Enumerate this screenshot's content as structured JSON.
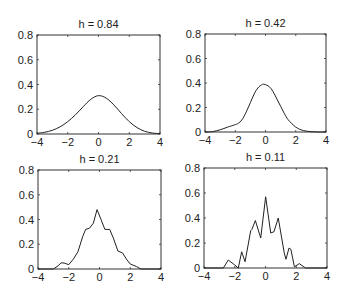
{
  "chart_data": [
    {
      "type": "line",
      "title": "h = 0.84",
      "xlabel": "",
      "ylabel": "",
      "xlim": [
        -4,
        4
      ],
      "ylim": [
        0,
        0.8
      ],
      "xticks": [
        -4,
        -2,
        0,
        2,
        4
      ],
      "yticks": [
        0,
        0.2,
        0.4,
        0.6,
        0.8
      ],
      "xtick_labels": [
        "−4",
        "−2",
        "0",
        "2",
        "4"
      ],
      "ytick_labels": [
        "0",
        "0.2",
        "0.4",
        "0.6",
        "0.8"
      ],
      "grid": false,
      "series": [
        {
          "name": "density",
          "x": [
            -4,
            -3.5,
            -3,
            -2.5,
            -2,
            -1.5,
            -1,
            -0.5,
            0,
            0.5,
            1,
            1.5,
            2,
            2.5,
            3,
            3.5,
            4
          ],
          "y": [
            0.006,
            0.014,
            0.03,
            0.058,
            0.1,
            0.155,
            0.22,
            0.28,
            0.31,
            0.29,
            0.235,
            0.165,
            0.1,
            0.052,
            0.022,
            0.008,
            0.003
          ]
        }
      ]
    },
    {
      "type": "line",
      "title": "h = 0.42",
      "xlabel": "",
      "ylabel": "",
      "xlim": [
        -4,
        4
      ],
      "ylim": [
        0,
        0.8
      ],
      "xticks": [
        -4,
        -2,
        0,
        2,
        4
      ],
      "yticks": [
        0,
        0.2,
        0.4,
        0.6,
        0.8
      ],
      "xtick_labels": [
        "−4",
        "−2",
        "0",
        "2",
        "4"
      ],
      "ytick_labels": [
        "0",
        "0.2",
        "0.4",
        "0.6",
        "0.8"
      ],
      "grid": false,
      "series": [
        {
          "name": "density",
          "x": [
            -4,
            -3.5,
            -3,
            -2.5,
            -2,
            -1.75,
            -1.5,
            -1.25,
            -1,
            -0.75,
            -0.5,
            -0.25,
            -0.1,
            0.25,
            0.5,
            0.75,
            1,
            1.25,
            1.5,
            2,
            2.5,
            3,
            3.5,
            4
          ],
          "y": [
            0.0,
            0.003,
            0.018,
            0.04,
            0.06,
            0.075,
            0.11,
            0.17,
            0.24,
            0.31,
            0.36,
            0.385,
            0.39,
            0.37,
            0.33,
            0.27,
            0.21,
            0.15,
            0.1,
            0.04,
            0.012,
            0.003,
            0.0,
            0.0
          ]
        }
      ]
    },
    {
      "type": "line",
      "title": "h = 0.21",
      "xlabel": "",
      "ylabel": "",
      "xlim": [
        -4,
        4
      ],
      "ylim": [
        0,
        0.8
      ],
      "xticks": [
        -4,
        -2,
        0,
        2,
        4
      ],
      "yticks": [
        0,
        0.2,
        0.4,
        0.6,
        0.8
      ],
      "xtick_labels": [
        "−4",
        "−2",
        "0",
        "2",
        "4"
      ],
      "ytick_labels": [
        "0",
        "0.2",
        "0.4",
        "0.6",
        "0.8"
      ],
      "grid": false,
      "series": [
        {
          "name": "density",
          "x": [
            -4,
            -3.0,
            -2.7,
            -2.5,
            -2.3,
            -2.0,
            -1.7,
            -1.4,
            -1.1,
            -0.9,
            -0.65,
            -0.4,
            -0.16,
            0.1,
            0.35,
            0.66,
            0.9,
            1.2,
            1.5,
            1.75,
            2.0,
            2.4,
            2.7,
            4
          ],
          "y": [
            0,
            0,
            0.025,
            0.05,
            0.048,
            0.035,
            0.08,
            0.14,
            0.26,
            0.32,
            0.33,
            0.37,
            0.48,
            0.4,
            0.32,
            0.32,
            0.25,
            0.145,
            0.13,
            0.08,
            0.04,
            0.02,
            0,
            0
          ]
        }
      ]
    },
    {
      "type": "line",
      "title": "h = 0.11",
      "xlabel": "",
      "ylabel": "",
      "xlim": [
        -4,
        4
      ],
      "ylim": [
        0,
        0.8
      ],
      "xticks": [
        -4,
        -2,
        0,
        2,
        4
      ],
      "yticks": [
        0,
        0.2,
        0.4,
        0.6,
        0.8
      ],
      "xtick_labels": [
        "−4",
        "−2",
        "0",
        "2",
        "4"
      ],
      "ytick_labels": [
        "0",
        "0.2",
        "0.4",
        "0.6",
        "0.8"
      ],
      "grid": false,
      "series": [
        {
          "name": "density",
          "x": [
            -4,
            -2.74,
            -2.42,
            -2.0,
            -1.77,
            -1.55,
            -1.33,
            -0.96,
            -0.88,
            -0.66,
            -0.31,
            0.01,
            0.34,
            0.55,
            0.83,
            1.22,
            1.33,
            1.53,
            1.65,
            1.88,
            2.2,
            2.6,
            4
          ],
          "y": [
            0,
            0,
            0.064,
            0.024,
            0.0,
            0.13,
            0.05,
            0.3,
            0.31,
            0.38,
            0.24,
            0.57,
            0.28,
            0.29,
            0.4,
            0.12,
            0.07,
            0.16,
            0.15,
            0.01,
            0.035,
            0,
            0
          ]
        }
      ]
    }
  ]
}
